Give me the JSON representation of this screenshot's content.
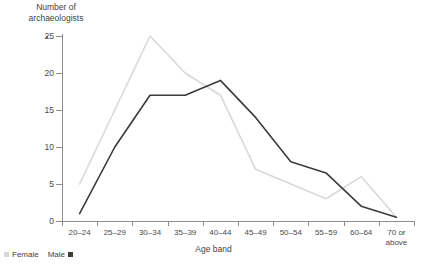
{
  "chart_data": {
    "type": "line",
    "title": "",
    "ylabel": "Number of\narchaeologists",
    "xlabel": "Age band",
    "categories": [
      "20–24",
      "25–29",
      "30–34",
      "35–39",
      "40–44",
      "45–49",
      "50–54",
      "55–59",
      "60–64",
      "70 or\nabove"
    ],
    "ylim": [
      0,
      25
    ],
    "yticks": [
      0,
      5,
      10,
      15,
      20,
      25
    ],
    "ytick_labels": [
      "0",
      "5",
      "10",
      "15",
      "20",
      "25"
    ],
    "grid": false,
    "legend_position": "bottom-left",
    "series": [
      {
        "name": "Female",
        "color": "#d9d9d9",
        "values": [
          5,
          15,
          25,
          20,
          17,
          7,
          5,
          3,
          6,
          0.5
        ]
      },
      {
        "name": "Male",
        "color": "#3b3b3b",
        "values": [
          1,
          10,
          17,
          17,
          19,
          14,
          8,
          6.5,
          2,
          0.5
        ]
      }
    ]
  },
  "legend": {
    "female_label": "Female",
    "male_label": "Male",
    "female_color": "#d9d9d9",
    "male_color": "#3b3b3b"
  },
  "axes": {
    "y_title": "Number of\narchaeologists",
    "x_title": "Age band"
  }
}
